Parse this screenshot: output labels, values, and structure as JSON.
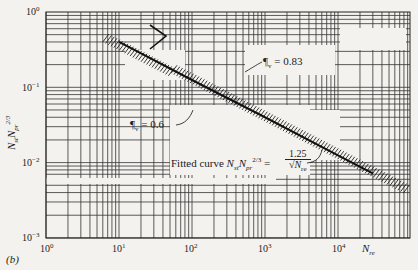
{
  "panel_label": "(b)",
  "chart_data": {
    "type": "line",
    "title": "",
    "xlabel": "N_re",
    "ylabel": "N_st N_pr^(2/3)",
    "xscale": "log",
    "yscale": "log",
    "xlim": [
      1,
      100000
    ],
    "ylim": [
      0.001,
      1
    ],
    "x_ticks": [
      "10^0",
      "10^1",
      "10^2",
      "10^3",
      "10^4"
    ],
    "y_ticks": [
      "10^0",
      "10^-1",
      "10^-2",
      "10^-3"
    ],
    "grid": true,
    "series": [
      {
        "name": "Fitted curve N_st N_pr^(2/3) = 1.25 / sqrt(N_re)",
        "x": [
          10,
          100,
          1000,
          10000,
          30000
        ],
        "y": [
          0.4,
          0.125,
          0.04,
          0.0125,
          0.0072
        ]
      }
    ],
    "annotations": [
      {
        "text": "εv = 0.83",
        "points_to": "upper hatched band near N_re ≈ 300"
      },
      {
        "text": "εv = 0.6",
        "points_to": "lower hatched band near N_re ≈ 200"
      },
      {
        "text": "Fitted curve N_st N_pr^(2/3) = 1.25 / √N_re"
      }
    ],
    "shaded_region": "hatched data band along fitted curve, N_re ≈ 5 to 10^5"
  },
  "labels": {
    "y_ticks": [
      "10",
      "10",
      "10",
      "10"
    ],
    "y_exps": [
      "0",
      "−1",
      "−2",
      "−3"
    ],
    "x_ticks": [
      "10",
      "10",
      "10",
      "10",
      "10"
    ],
    "x_exps": [
      "0",
      "1",
      "2",
      "3",
      "4"
    ],
    "x_axis": "N",
    "x_axis_sub": "re",
    "eps_083": "¶",
    "eps_083_val": "= 0.83",
    "eps_06_val": "= 0.6",
    "eps_sub": "v",
    "fitted_prefix": "Fitted curve",
    "fitted_num": "1.25",
    "fitted_den": "N",
    "fitted_den_sub": "re"
  }
}
